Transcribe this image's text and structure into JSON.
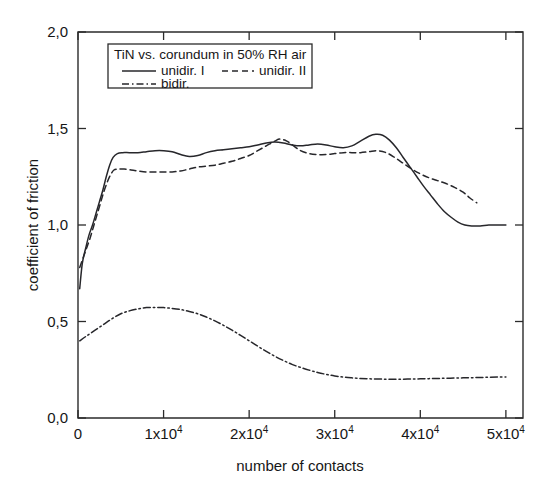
{
  "chart_data": {
    "type": "line",
    "title": "",
    "xlabel": "number of contacts",
    "ylabel": "coefficient of friction",
    "xlim": [
      0,
      52000
    ],
    "ylim": [
      0.0,
      2.0
    ],
    "grid": false,
    "legend_position": "top-left-inside",
    "legend_title": "TiN vs. corundum in 50% RH air",
    "xticks": [
      0,
      10000,
      20000,
      30000,
      40000,
      50000
    ],
    "xtick_labels": [
      "0",
      "1x10",
      "2x10",
      "3x10",
      "4x10",
      "5x10"
    ],
    "xtick_exponent": "4",
    "yticks": [
      0.0,
      0.5,
      1.0,
      1.5,
      2.0
    ],
    "ytick_labels": [
      "0,0",
      "0,5",
      "1,0",
      "1,5",
      "2,0"
    ],
    "series": [
      {
        "name": "unidir. I",
        "style": "solid",
        "color": "#27272b",
        "points": [
          [
            200,
            0.67
          ],
          [
            500,
            0.8
          ],
          [
            900,
            0.88
          ],
          [
            1300,
            0.95
          ],
          [
            1700,
            1.0
          ],
          [
            2100,
            1.06
          ],
          [
            2500,
            1.12
          ],
          [
            2900,
            1.18
          ],
          [
            3300,
            1.25
          ],
          [
            3700,
            1.31
          ],
          [
            4100,
            1.35
          ],
          [
            4600,
            1.37
          ],
          [
            5200,
            1.375
          ],
          [
            6000,
            1.375
          ],
          [
            7000,
            1.375
          ],
          [
            8000,
            1.38
          ],
          [
            9000,
            1.385
          ],
          [
            10000,
            1.385
          ],
          [
            11000,
            1.38
          ],
          [
            12000,
            1.365
          ],
          [
            13000,
            1.355
          ],
          [
            14000,
            1.36
          ],
          [
            15000,
            1.375
          ],
          [
            16000,
            1.385
          ],
          [
            17000,
            1.39
          ],
          [
            18000,
            1.395
          ],
          [
            19000,
            1.4
          ],
          [
            20000,
            1.405
          ],
          [
            21000,
            1.415
          ],
          [
            22000,
            1.425
          ],
          [
            23000,
            1.43
          ],
          [
            24000,
            1.425
          ],
          [
            25000,
            1.415
          ],
          [
            26000,
            1.41
          ],
          [
            27000,
            1.415
          ],
          [
            28000,
            1.42
          ],
          [
            29000,
            1.415
          ],
          [
            30000,
            1.405
          ],
          [
            31000,
            1.4
          ],
          [
            32000,
            1.41
          ],
          [
            33000,
            1.435
          ],
          [
            34000,
            1.46
          ],
          [
            34800,
            1.47
          ],
          [
            35600,
            1.465
          ],
          [
            36400,
            1.44
          ],
          [
            37200,
            1.4
          ],
          [
            38000,
            1.35
          ],
          [
            38800,
            1.3
          ],
          [
            39600,
            1.25
          ],
          [
            40400,
            1.2
          ],
          [
            41200,
            1.155
          ],
          [
            42000,
            1.11
          ],
          [
            42800,
            1.07
          ],
          [
            43600,
            1.04
          ],
          [
            44400,
            1.015
          ],
          [
            45200,
            1.0
          ],
          [
            46000,
            0.995
          ],
          [
            47000,
            0.995
          ],
          [
            48000,
            1.0
          ],
          [
            49000,
            1.0
          ],
          [
            50000,
            1.0
          ]
        ]
      },
      {
        "name": "unidir. II",
        "style": "dashed",
        "color": "#27272b",
        "points": [
          [
            200,
            0.78
          ],
          [
            600,
            0.83
          ],
          [
            1000,
            0.88
          ],
          [
            1400,
            0.93
          ],
          [
            1800,
            0.99
          ],
          [
            2200,
            1.05
          ],
          [
            2600,
            1.11
          ],
          [
            3000,
            1.17
          ],
          [
            3400,
            1.22
          ],
          [
            3800,
            1.26
          ],
          [
            4200,
            1.285
          ],
          [
            4700,
            1.29
          ],
          [
            5400,
            1.29
          ],
          [
            6200,
            1.285
          ],
          [
            7000,
            1.28
          ],
          [
            8000,
            1.275
          ],
          [
            9000,
            1.275
          ],
          [
            10000,
            1.275
          ],
          [
            11000,
            1.275
          ],
          [
            12000,
            1.28
          ],
          [
            13000,
            1.29
          ],
          [
            14000,
            1.3
          ],
          [
            15000,
            1.305
          ],
          [
            16000,
            1.31
          ],
          [
            17000,
            1.32
          ],
          [
            18000,
            1.33
          ],
          [
            19000,
            1.345
          ],
          [
            20000,
            1.36
          ],
          [
            21000,
            1.385
          ],
          [
            22000,
            1.41
          ],
          [
            23000,
            1.435
          ],
          [
            23600,
            1.445
          ],
          [
            24400,
            1.435
          ],
          [
            25200,
            1.41
          ],
          [
            26000,
            1.385
          ],
          [
            27000,
            1.37
          ],
          [
            28000,
            1.365
          ],
          [
            29000,
            1.365
          ],
          [
            30000,
            1.37
          ],
          [
            31000,
            1.375
          ],
          [
            32000,
            1.375
          ],
          [
            33000,
            1.375
          ],
          [
            34000,
            1.38
          ],
          [
            35000,
            1.385
          ],
          [
            36000,
            1.375
          ],
          [
            37000,
            1.35
          ],
          [
            38000,
            1.32
          ],
          [
            39000,
            1.29
          ],
          [
            40000,
            1.265
          ],
          [
            41000,
            1.245
          ],
          [
            42000,
            1.23
          ],
          [
            43000,
            1.215
          ],
          [
            44000,
            1.195
          ],
          [
            45000,
            1.17
          ],
          [
            45800,
            1.14
          ],
          [
            46600,
            1.115
          ]
        ]
      },
      {
        "name": "bidir.",
        "style": "dash-dot",
        "color": "#27272b",
        "points": [
          [
            200,
            0.4
          ],
          [
            1000,
            0.425
          ],
          [
            2000,
            0.455
          ],
          [
            3000,
            0.485
          ],
          [
            4000,
            0.515
          ],
          [
            5000,
            0.54
          ],
          [
            6000,
            0.555
          ],
          [
            7000,
            0.565
          ],
          [
            8000,
            0.572
          ],
          [
            9000,
            0.573
          ],
          [
            10000,
            0.572
          ],
          [
            11000,
            0.568
          ],
          [
            12000,
            0.562
          ],
          [
            13000,
            0.552
          ],
          [
            14000,
            0.54
          ],
          [
            15000,
            0.523
          ],
          [
            16000,
            0.503
          ],
          [
            17000,
            0.48
          ],
          [
            18000,
            0.455
          ],
          [
            19000,
            0.428
          ],
          [
            20000,
            0.4
          ],
          [
            21000,
            0.372
          ],
          [
            22000,
            0.345
          ],
          [
            23000,
            0.32
          ],
          [
            24000,
            0.298
          ],
          [
            25000,
            0.278
          ],
          [
            26000,
            0.262
          ],
          [
            27000,
            0.248
          ],
          [
            28000,
            0.236
          ],
          [
            29000,
            0.226
          ],
          [
            30000,
            0.218
          ],
          [
            31000,
            0.212
          ],
          [
            32000,
            0.208
          ],
          [
            33000,
            0.205
          ],
          [
            34000,
            0.203
          ],
          [
            35000,
            0.202
          ],
          [
            36000,
            0.201
          ],
          [
            37000,
            0.201
          ],
          [
            38000,
            0.201
          ],
          [
            39000,
            0.202
          ],
          [
            40000,
            0.203
          ],
          [
            41000,
            0.204
          ],
          [
            42000,
            0.205
          ],
          [
            43000,
            0.206
          ],
          [
            44000,
            0.207
          ],
          [
            45000,
            0.208
          ],
          [
            46000,
            0.209
          ],
          [
            47000,
            0.21
          ],
          [
            48000,
            0.211
          ],
          [
            49000,
            0.212
          ],
          [
            50000,
            0.213
          ]
        ]
      }
    ]
  }
}
